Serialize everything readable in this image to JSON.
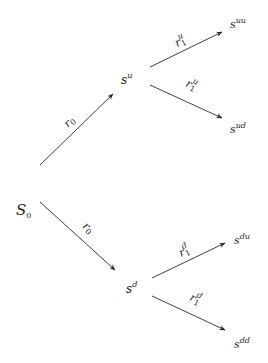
{
  "diagram": {
    "type": "binomial-tree",
    "colors": {
      "line": "#2a2a2a",
      "text": "#222222",
      "background": "#ffffff"
    },
    "nodes": {
      "root": {
        "base": "S",
        "sub": "0"
      },
      "u": {
        "base": "s",
        "sup": "u"
      },
      "d": {
        "base": "s",
        "sup": "d"
      },
      "uu": {
        "base": "s",
        "sup": "uu"
      },
      "ud": {
        "base": "s",
        "sup": "ud"
      },
      "du": {
        "base": "s",
        "sup": "du"
      },
      "dd": {
        "base": "s",
        "sup": "dd"
      }
    },
    "edges": {
      "root_u": {
        "base": "r",
        "sub": "0"
      },
      "root_d": {
        "base": "r",
        "sub": "0"
      },
      "u_uu": {
        "base": "r",
        "sub": "1",
        "sup": "u"
      },
      "u_ud": {
        "base": "r",
        "sub": "1",
        "sup": "u"
      },
      "d_du": {
        "base": "r",
        "sub": "1",
        "sup": "d"
      },
      "d_dd": {
        "base": "r",
        "sub": "1",
        "sup": "d"
      }
    }
  }
}
